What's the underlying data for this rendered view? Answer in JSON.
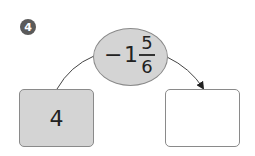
{
  "problem_number": "4",
  "operation": {
    "sign": "−",
    "whole": "1",
    "numerator": "5",
    "denominator": "6"
  },
  "input_box": {
    "value": "4"
  },
  "output_box": {
    "value": ""
  },
  "colors": {
    "badge": "#5a5a5a",
    "fill_gray": "#d4d4d4",
    "border": "#8a8a8a"
  }
}
